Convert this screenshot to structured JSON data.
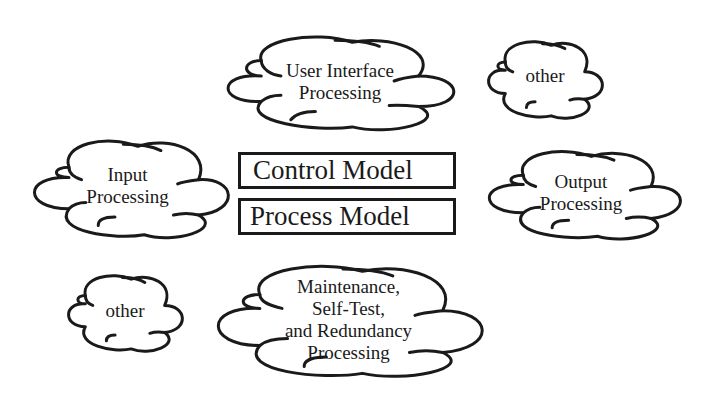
{
  "diagram": {
    "center_boxes": [
      {
        "label": "Control Model"
      },
      {
        "label": "Process Model"
      }
    ],
    "clouds": {
      "user_interface": {
        "lines": [
          "User Interface",
          "Processing"
        ]
      },
      "other_top": {
        "lines": [
          "other"
        ]
      },
      "input": {
        "lines": [
          "Input",
          "Processing"
        ]
      },
      "output": {
        "lines": [
          "Output",
          "Processing"
        ]
      },
      "other_bottom": {
        "lines": [
          "other"
        ]
      },
      "maintenance": {
        "lines": [
          "Maintenance,",
          "Self-Test,",
          "and Redundancy",
          "Processing"
        ]
      }
    },
    "colors": {
      "stroke": "#1a1a1a",
      "background": "#ffffff"
    }
  }
}
